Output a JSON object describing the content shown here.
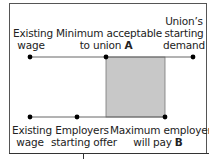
{
  "diagram": {
    "colors": {
      "line": "#666666",
      "dot": "#000000",
      "zone": "#c8c8c8",
      "zone_border": "#777777"
    },
    "top_labels": [
      {
        "lines": [
          "Existing",
          "wage"
        ],
        "emphasis": ""
      },
      {
        "lines": [
          "Minimum acceptable",
          "to union "
        ],
        "emphasis": "A"
      },
      {
        "lines": [
          "Union’s",
          "starting",
          "demand"
        ],
        "emphasis": ""
      }
    ],
    "bottom_labels": [
      {
        "lines": [
          "Existing",
          "wage"
        ],
        "emphasis": ""
      },
      {
        "lines": [
          "Employers",
          "starting offer"
        ],
        "emphasis": ""
      },
      {
        "lines": [
          "Maximum employer",
          "will pay "
        ],
        "emphasis": "B"
      }
    ]
  }
}
